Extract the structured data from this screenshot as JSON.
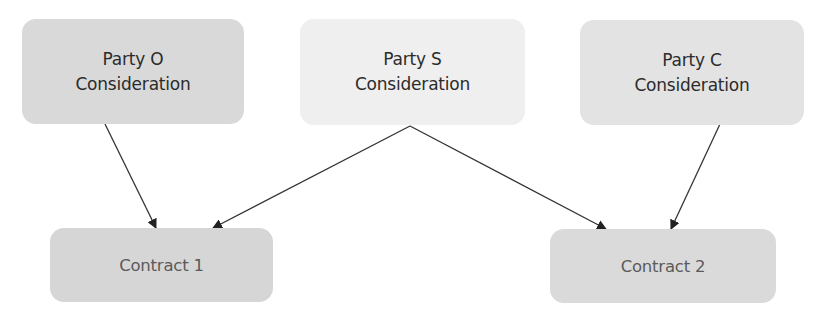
{
  "diagram": {
    "nodes": [
      {
        "id": "party_o",
        "label": "Party O\nConsideration",
        "fill": "#d9d9d9"
      },
      {
        "id": "party_s",
        "label": "Party S\nConsideration",
        "fill": "#efefef"
      },
      {
        "id": "party_c",
        "label": "Party C\nConsideration",
        "fill": "#e3e3e3"
      },
      {
        "id": "contract_1",
        "label": "Contract 1",
        "fill": "#d6d6d6"
      },
      {
        "id": "contract_2",
        "label": "Contract 2",
        "fill": "#dadada"
      }
    ],
    "edges": [
      {
        "from": "party_o",
        "to": "contract_1"
      },
      {
        "from": "party_s",
        "to": "contract_1"
      },
      {
        "from": "party_s",
        "to": "contract_2"
      },
      {
        "from": "party_c",
        "to": "contract_2"
      }
    ],
    "edge_color": "#333333"
  }
}
